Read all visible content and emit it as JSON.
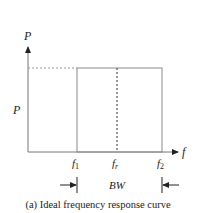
{
  "diagram": {
    "y_axis_label": "P",
    "x_axis_label": "f",
    "level_label": "P",
    "ticks": {
      "f1": "f",
      "f1_sub": "1",
      "fr": "f",
      "fr_sub": "r",
      "f2": "f",
      "f2_sub": "2"
    },
    "bandwidth_label": "BW",
    "caption": "(a) Ideal frequency response curve",
    "colors": {
      "line": "#8a8a8a",
      "axis": "#777777",
      "text": "#222222"
    }
  }
}
